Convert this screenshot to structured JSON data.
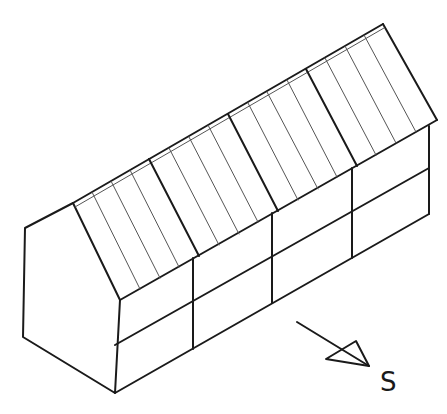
{
  "diagram": {
    "title": "",
    "compass": {
      "label": "S",
      "arrow_direction": "south-east"
    },
    "roof": {
      "panel_groups": 4,
      "strips_per_group": 4
    },
    "facade": {
      "bays": 4,
      "rows": 2
    },
    "colors": {
      "line": "#1a1a1a",
      "thin_line": "#555555",
      "background": "#ffffff"
    }
  }
}
